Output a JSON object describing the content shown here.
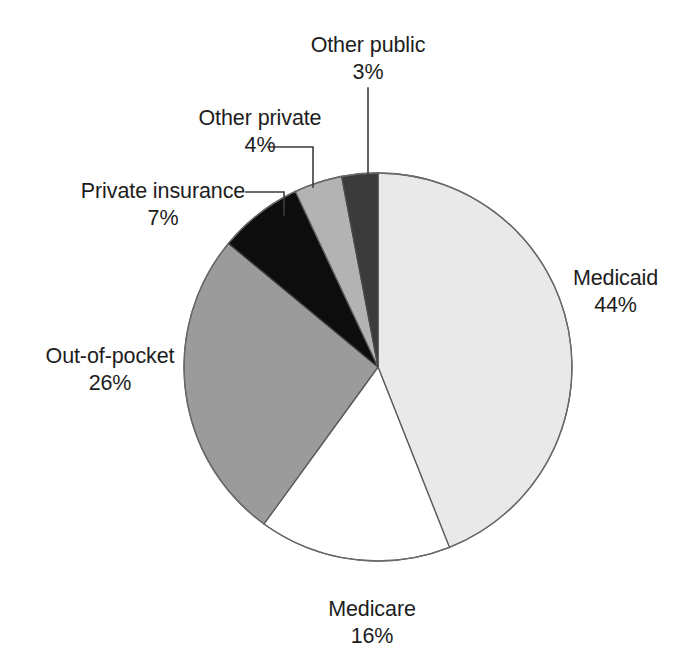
{
  "chart_data": {
    "type": "pie",
    "title": "",
    "subtitle": "",
    "xlabel": "",
    "ylabel": "",
    "legend_position": "none",
    "grid": false,
    "units": "percent",
    "start_angle_deg": 0,
    "direction": "clockwise",
    "categories": [
      "Medicaid",
      "Medicare",
      "Out-of-pocket",
      "Private insurance",
      "Other private",
      "Other public"
    ],
    "values": [
      44,
      16,
      26,
      7,
      4,
      3
    ],
    "labels": [
      "44%",
      "16%",
      "26%",
      "7%",
      "4%",
      "3%"
    ],
    "colors": [
      "#e9e9e9",
      "#ffffff",
      "#9b9b9b",
      "#0d0d0d",
      "#b3b3b3",
      "#3b3b3b"
    ],
    "slices": [
      {
        "name": "Medicaid",
        "value": 44,
        "label": "44%",
        "color": "#e9e9e9",
        "start_deg": 0.0,
        "end_deg": 158.4,
        "leader": false
      },
      {
        "name": "Medicare",
        "value": 16,
        "label": "16%",
        "color": "#ffffff",
        "start_deg": 158.4,
        "end_deg": 216.0,
        "leader": false
      },
      {
        "name": "Out-of-pocket",
        "value": 26,
        "label": "26%",
        "color": "#9b9b9b",
        "start_deg": 216.0,
        "end_deg": 309.6,
        "leader": false
      },
      {
        "name": "Private insurance",
        "value": 7,
        "label": "7%",
        "color": "#0d0d0d",
        "start_deg": 309.6,
        "end_deg": 334.8,
        "leader": true
      },
      {
        "name": "Other private",
        "value": 4,
        "label": "4%",
        "color": "#b3b3b3",
        "start_deg": 334.8,
        "end_deg": 349.2,
        "leader": true
      },
      {
        "name": "Other public",
        "value": 3,
        "label": "3%",
        "color": "#3b3b3b",
        "start_deg": 349.2,
        "end_deg": 360.0,
        "leader": true
      }
    ]
  },
  "labels": {
    "other_public": {
      "name": "Other public",
      "percent": "3%"
    },
    "other_private": {
      "name": "Other private",
      "percent": "4%"
    },
    "private_insurance": {
      "name": "Private insurance",
      "percent": "7%"
    },
    "out_of_pocket": {
      "name": "Out-of-pocket",
      "percent": "26%"
    },
    "medicaid": {
      "name": "Medicaid",
      "percent": "44%"
    },
    "medicare": {
      "name": "Medicare",
      "percent": "16%"
    }
  },
  "style": {
    "background": "#ffffff",
    "outline": "#555555",
    "leader_line": "#3c3c3c",
    "text": "#1d1d1d"
  }
}
